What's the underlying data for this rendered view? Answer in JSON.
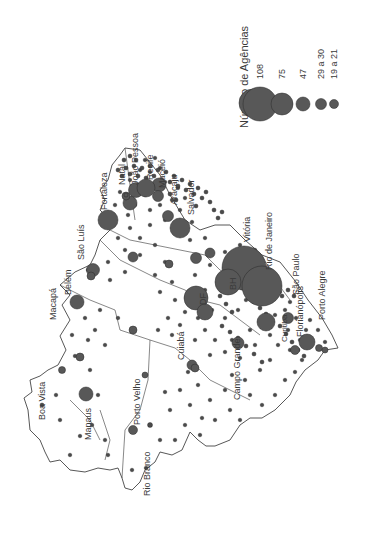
{
  "map": {
    "orientation": "rotated 90 degrees counter-clockwise",
    "legend": {
      "title": "Número de Agências",
      "classes": [
        {
          "label": "108",
          "r": 22
        },
        {
          "label": "75",
          "r": 14
        },
        {
          "label": "47",
          "r": 9.5
        },
        {
          "label": "29 a 30",
          "r": 7
        },
        {
          "label": "19 a 21",
          "r": 5.5
        },
        {
          "label": "11",
          "r": 4
        },
        {
          "label": "7 a 10",
          "r": 3.3
        },
        {
          "label": "4 a 6",
          "r": 3
        },
        {
          "label": "2 e 3",
          "r": 2.2
        },
        {
          "label": "1",
          "r": 1.5
        }
      ],
      "abbreviations": [
        "BH (Belo Horizonte)",
        "DF (Distrito Federal)"
      ],
      "scale": {
        "ticks": [
          "0",
          "944 km",
          "1.888 km"
        ]
      }
    },
    "north_arrow": {
      "label": "N"
    },
    "cities": [
      {
        "name": "Boa Vista"
      },
      {
        "name": "Macapá"
      },
      {
        "name": "Manaus"
      },
      {
        "name": "Belém"
      },
      {
        "name": "São Luís"
      },
      {
        "name": "Fortaleza"
      },
      {
        "name": "Natal"
      },
      {
        "name": "João Pessoa"
      },
      {
        "name": "Recife"
      },
      {
        "name": "Maceió"
      },
      {
        "name": "Aracaju"
      },
      {
        "name": "Salvador"
      },
      {
        "name": "Vitória"
      },
      {
        "name": "Rio de Janeiro"
      },
      {
        "name": "São Paulo"
      },
      {
        "name": "Curitiba"
      },
      {
        "name": "Florianópolis"
      },
      {
        "name": "Porto Alegre"
      },
      {
        "name": "Campo Grande"
      },
      {
        "name": "Cuiabá"
      },
      {
        "name": "Porto Velho"
      },
      {
        "name": "Rio Branco"
      },
      {
        "name": "DF"
      },
      {
        "name": "BH"
      }
    ],
    "colors": {
      "symbol": "#555555",
      "outline": "#444444",
      "text": "#3a3a3a"
    }
  }
}
